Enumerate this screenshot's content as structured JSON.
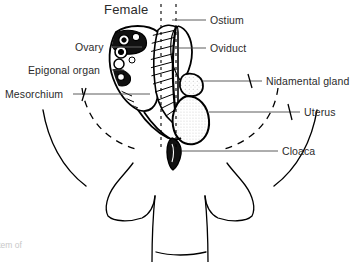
{
  "figure": {
    "title": "Female",
    "title_x": 104,
    "title_y": 2,
    "background_color": "#ffffff",
    "line_color": "#000000",
    "text_color": "#2b2b2b",
    "caption_fragment": "stem of",
    "caption_fragment_color": "#c8c8c8"
  },
  "labels": [
    {
      "name": "ostium",
      "text": "Ostium",
      "side": "right",
      "x": 210,
      "y": 14
    },
    {
      "name": "oviduct",
      "text": "Oviduct",
      "side": "right",
      "x": 210,
      "y": 42
    },
    {
      "name": "nidamental-gland",
      "text": "Nidamental gland",
      "side": "right",
      "x": 266,
      "y": 75
    },
    {
      "name": "uterus",
      "text": "Uterus",
      "side": "right",
      "x": 304,
      "y": 106
    },
    {
      "name": "cloaca",
      "text": "Cloaca",
      "side": "right",
      "x": 282,
      "y": 145
    },
    {
      "name": "ovary",
      "text": "Ovary",
      "side": "left",
      "x": 75,
      "y": 41
    },
    {
      "name": "epigonal-organ",
      "text": "Epigonal organ",
      "side": "left",
      "x": 28,
      "y": 64
    },
    {
      "name": "mesorchium",
      "text": "Mesorchium",
      "side": "left",
      "x": 5,
      "y": 88
    }
  ],
  "anatomy": {
    "parts": [
      "ovary-follicles",
      "oviduct-tube",
      "epigonal-organ-mass",
      "nidamental-gland-bulge",
      "uterus-sac",
      "cloaca-opening",
      "body-outline",
      "pelvic-fins",
      "tail",
      "mesorchium-arc"
    ]
  }
}
